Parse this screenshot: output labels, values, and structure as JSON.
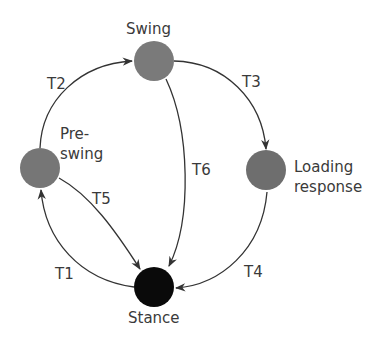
{
  "diagram": {
    "type": "state-machine",
    "nodes": [
      {
        "id": "swing",
        "label": "Swing",
        "color": "#7a7a7a"
      },
      {
        "id": "preswing",
        "label_line1": "Pre-",
        "label_line2": "swing",
        "color": "#7a7a7a"
      },
      {
        "id": "loading",
        "label_line1": "Loading",
        "label_line2": "response",
        "color": "#6e6e6e"
      },
      {
        "id": "stance",
        "label": "Stance",
        "color": "#0a0a0a"
      }
    ],
    "edges": [
      {
        "id": "T1",
        "label": "T1",
        "from": "stance",
        "to": "preswing"
      },
      {
        "id": "T2",
        "label": "T2",
        "from": "preswing",
        "to": "swing"
      },
      {
        "id": "T3",
        "label": "T3",
        "from": "swing",
        "to": "loading"
      },
      {
        "id": "T4",
        "label": "T4",
        "from": "loading",
        "to": "stance"
      },
      {
        "id": "T5",
        "label": "T5",
        "from": "preswing",
        "to": "stance"
      },
      {
        "id": "T6",
        "label": "T6",
        "from": "swing",
        "to": "stance"
      }
    ]
  }
}
